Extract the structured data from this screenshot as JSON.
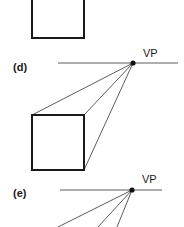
{
  "figure": {
    "panels": [
      {
        "id": "c",
        "label": "",
        "description": "Square drawn in front view (partially visible)"
      },
      {
        "id": "d",
        "label": "(d)",
        "vp_label": "VP",
        "description": "Square with three corners connected to the vanishing point on the horizon line"
      },
      {
        "id": "e",
        "label": "(e)",
        "vp_label": "VP",
        "description": "Lines radiating from the vanishing point down and to the left (partially visible)"
      }
    ]
  }
}
